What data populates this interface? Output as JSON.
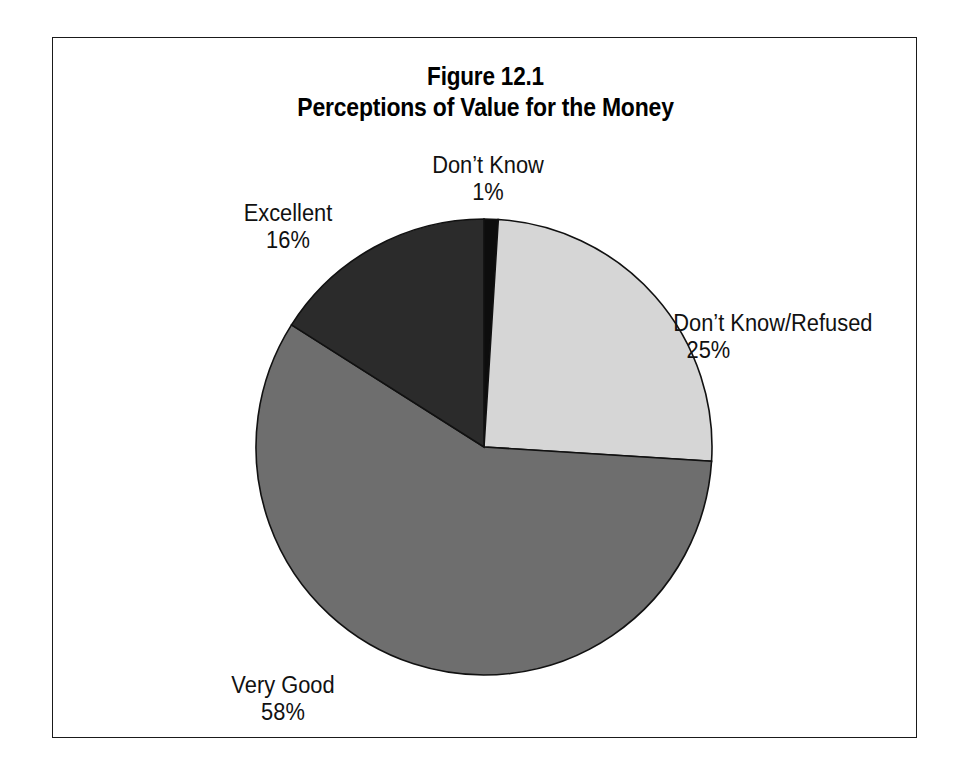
{
  "figure": {
    "title_line1": "Figure 12.1",
    "title_line2": "Perceptions of Value for the Money",
    "frame_color": "#1a1a1a",
    "background": "#ffffff"
  },
  "labels": {
    "dont_know": {
      "name": "Don’t Know",
      "value": "1%"
    },
    "excellent": {
      "name": "Excellent",
      "value": "16%"
    },
    "dont_know_refused": {
      "name": "Don’t Know/Refused",
      "value": "25%"
    },
    "very_good": {
      "name": "Very Good",
      "value": "58%"
    }
  },
  "chart_data": {
    "type": "pie",
    "subtitle": "Perceptions of Value for the Money",
    "xlabel": "",
    "ylabel": "",
    "grid": false,
    "legend": "none (slices labeled directly)",
    "start_angle_deg": 0,
    "direction": "clockwise",
    "units": "percent",
    "total": 100,
    "categories": [
      "Don’t Know",
      "Don’t Know/Refused",
      "Very Good",
      "Excellent"
    ],
    "values": [
      1,
      25,
      58,
      16
    ],
    "slices": [
      {
        "label": "Don’t Know",
        "value": 1,
        "value_text": "1%",
        "color": "#0d0d0d",
        "start_angle_deg": 0,
        "end_angle_deg": 3.6,
        "label_position": "top"
      },
      {
        "label": "Don’t Know/Refused",
        "value": 25,
        "value_text": "25%",
        "color": "#d6d6d6",
        "start_angle_deg": 3.6,
        "end_angle_deg": 93.6,
        "label_position": "right"
      },
      {
        "label": "Very Good",
        "value": 58,
        "value_text": "58%",
        "color": "#6e6e6e",
        "start_angle_deg": 93.6,
        "end_angle_deg": 302.4,
        "label_position": "bottom-left"
      },
      {
        "label": "Excellent",
        "value": 16,
        "value_text": "16%",
        "color": "#2b2b2b",
        "start_angle_deg": 302.4,
        "end_angle_deg": 360,
        "label_position": "upper-left"
      }
    ],
    "slice_outline_color": "#111111"
  }
}
